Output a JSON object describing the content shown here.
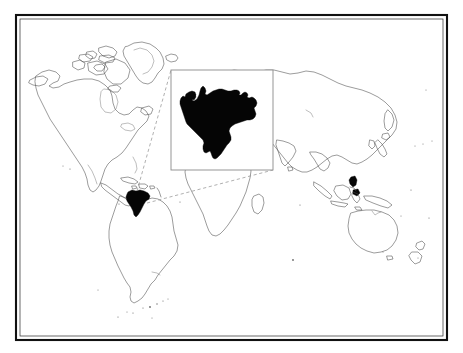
{
  "figure": {
    "type": "locator-map",
    "title": "",
    "subtitle": "",
    "caption": "",
    "background_color": "#ffffff",
    "frame": {
      "outer_color": "#111111",
      "inner_color": "#2a2a2a",
      "x": 15,
      "y": 14,
      "width": 433,
      "height": 327
    }
  },
  "chart_data": {
    "type": "map",
    "title": "",
    "xlabel": "",
    "ylabel": "",
    "projection": "equirectangular-world",
    "grid": false,
    "legend_position": "none",
    "highlight_color": "#050505",
    "coastline_color": "#4a4a4a",
    "highlighted_regions": [
      {
        "name": "Venezuela",
        "color": "#050505",
        "main_map_position": {
          "x": 138,
          "y": 203
        },
        "inset": true
      }
    ],
    "annotations": []
  },
  "world_map": {
    "label": "world-map",
    "landmasses": [
      "North America",
      "Greenland",
      "Canadian Arctic Archipelago",
      "South America",
      "Africa",
      "Madagascar",
      "Europe",
      "Asia",
      "Arabian Peninsula",
      "Indian Subcontinent",
      "Japan",
      "Philippines",
      "Indonesia",
      "New Guinea",
      "Australia",
      "New Zealand",
      "Iceland",
      "British Isles",
      "Caribbean Islands",
      "Falkland Islands",
      "South Georgia"
    ]
  },
  "inset": {
    "label": "venezuela-inset",
    "region_name": "Venezuela",
    "box": {
      "x": 171,
      "y": 70,
      "width": 102,
      "height": 100
    },
    "border_color": "#8a8a8a",
    "fill_color": "#ffffff",
    "shape_color": "#050505"
  },
  "leader_lines": {
    "label": "inset-leader-lines",
    "color": "#8e8e8e",
    "style": "dashed",
    "count": 2
  }
}
